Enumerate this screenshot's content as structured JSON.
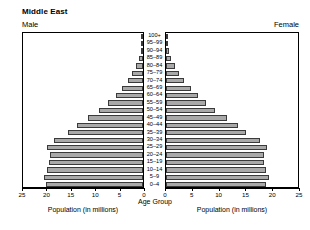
{
  "header": {
    "title": "Middle East",
    "left_label": "Male",
    "right_label": "Female"
  },
  "axes": {
    "male_title": "Population (in millions)",
    "female_title": "Population (in millions)",
    "age_title": "Age Group",
    "male_ticks": [
      "25",
      "20",
      "15",
      "10",
      "5",
      "0"
    ],
    "female_ticks": [
      "0",
      "5",
      "10",
      "15",
      "20",
      "25"
    ]
  },
  "chart_data": {
    "type": "bar",
    "title": "Middle East",
    "subtype": "population-pyramid",
    "xlabel": "Population (in millions)",
    "ylabel": "Age Group",
    "xlim": [
      0,
      25
    ],
    "grid": false,
    "legend_position": "top-corners",
    "categories": [
      "100+",
      "95–99",
      "90–94",
      "85–89",
      "80–84",
      "75–79",
      "70–74",
      "65–69",
      "60–64",
      "55–59",
      "50–54",
      "45–49",
      "40–44",
      "35–39",
      "30–34",
      "25–29",
      "20–24",
      "15–19",
      "10–14",
      "5–9",
      "0–4"
    ],
    "series": [
      {
        "name": "Male",
        "side": "left",
        "color": "#a9a9a9",
        "values": [
          0.05,
          0.15,
          0.4,
          0.8,
          1.4,
          2.2,
          3.1,
          4.3,
          5.6,
          7.2,
          9.0,
          11.2,
          13.6,
          15.3,
          18.2,
          19.6,
          19.0,
          19.2,
          19.7,
          20.2,
          19.9
        ]
      },
      {
        "name": "Female",
        "side": "right",
        "color": "#a9a9a9",
        "values": [
          0.08,
          0.22,
          0.55,
          1.0,
          1.7,
          2.5,
          3.4,
          4.6,
          5.9,
          7.5,
          9.2,
          11.3,
          13.4,
          14.9,
          17.5,
          18.8,
          18.2,
          18.3,
          18.7,
          19.3,
          18.6
        ]
      }
    ]
  }
}
